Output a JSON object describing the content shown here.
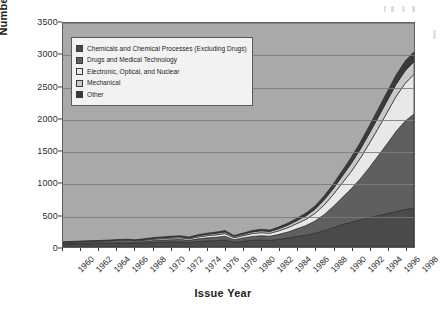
{
  "chart_data": {
    "type": "area",
    "stacked": true,
    "title": "",
    "xlabel": "Issue Year",
    "ylabel": "Number of Patents",
    "ylim": [
      0,
      3500
    ],
    "ytick_step": 500,
    "yticks": [
      "0",
      "500",
      "1000",
      "1500",
      "2000",
      "2500",
      "3000",
      "3500"
    ],
    "grid": true,
    "legend_position": "inside-top-left",
    "x": [
      1960,
      1961,
      1962,
      1963,
      1964,
      1965,
      1966,
      1967,
      1968,
      1969,
      1970,
      1971,
      1972,
      1973,
      1974,
      1975,
      1976,
      1977,
      1978,
      1979,
      1980,
      1981,
      1982,
      1983,
      1984,
      1985,
      1986,
      1987,
      1988,
      1989,
      1990,
      1991,
      1992,
      1993,
      1994,
      1995,
      1996,
      1997,
      1998,
      1999
    ],
    "xtick_labels": [
      "1960",
      "1962",
      "1964",
      "1966",
      "1968",
      "1970",
      "1972",
      "1974",
      "1976",
      "1978",
      "1980",
      "1982",
      "1984",
      "1986",
      "1988",
      "1990",
      "1992",
      "1994",
      "1996",
      "1998"
    ],
    "series": [
      {
        "name": "Chemicals and Chemical Processes (Excluding Drugs)",
        "color": "#4a4a4a",
        "values": [
          40,
          45,
          48,
          50,
          52,
          55,
          58,
          60,
          55,
          62,
          70,
          75,
          78,
          80,
          70,
          85,
          95,
          100,
          110,
          75,
          90,
          105,
          110,
          105,
          120,
          140,
          165,
          185,
          215,
          255,
          300,
          350,
          385,
          420,
          455,
          490,
          520,
          555,
          585,
          610
        ]
      },
      {
        "name": "Drugs and Medical Technology",
        "color": "#5f5f5f",
        "values": [
          15,
          16,
          17,
          18,
          19,
          20,
          22,
          24,
          22,
          26,
          30,
          33,
          36,
          38,
          34,
          42,
          48,
          52,
          58,
          40,
          50,
          60,
          66,
          64,
          78,
          95,
          120,
          150,
          190,
          250,
          330,
          420,
          520,
          640,
          780,
          930,
          1090,
          1250,
          1380,
          1470
        ]
      },
      {
        "name": "Electronic, Optical, and Nuclear",
        "color": "#e8e8e8",
        "values": [
          10,
          11,
          12,
          12,
          13,
          14,
          15,
          16,
          15,
          17,
          20,
          22,
          24,
          26,
          23,
          30,
          34,
          38,
          42,
          30,
          36,
          44,
          48,
          46,
          56,
          68,
          82,
          98,
          120,
          150,
          185,
          225,
          270,
          320,
          375,
          430,
          490,
          545,
          590,
          620
        ]
      },
      {
        "name": "Mechanical",
        "color": "#c9c9c9",
        "values": [
          8,
          8,
          9,
          9,
          10,
          10,
          11,
          12,
          11,
          13,
          14,
          15,
          16,
          17,
          15,
          19,
          21,
          23,
          26,
          19,
          22,
          26,
          29,
          28,
          33,
          39,
          46,
          54,
          64,
          78,
          92,
          108,
          124,
          140,
          156,
          170,
          182,
          190,
          194,
          196
        ]
      },
      {
        "name": "Other",
        "color": "#3a3a3a",
        "values": [
          7,
          7,
          8,
          8,
          8,
          9,
          9,
          10,
          9,
          11,
          12,
          13,
          14,
          15,
          13,
          16,
          18,
          20,
          22,
          16,
          19,
          22,
          24,
          23,
          28,
          33,
          38,
          44,
          52,
          62,
          72,
          84,
          96,
          108,
          120,
          131,
          140,
          147,
          152,
          156
        ]
      }
    ],
    "totals_note": "Stacked totals rise from ~80 in 1960 to ~3050 in 1999"
  },
  "legend": {
    "items": [
      {
        "label": "Chemicals and Chemical Processes (Excluding Drugs)",
        "color": "#4a4a4a"
      },
      {
        "label": "Drugs and Medical Technology",
        "color": "#5f5f5f"
      },
      {
        "label": "Electronic, Optical, and Nuclear",
        "color": "#e8e8e8"
      },
      {
        "label": "Mechanical",
        "color": "#c9c9c9"
      },
      {
        "label": "Other",
        "color": "#3a3a3a"
      }
    ]
  },
  "axes": {
    "y_title": "Number of Patents",
    "x_title": "Issue Year"
  },
  "style": {
    "plot_background": "#a9a9a9",
    "page_background": "#ffffff",
    "gridline_color": "#7a7a7a",
    "axis_text_color": "#2b2b2b"
  }
}
